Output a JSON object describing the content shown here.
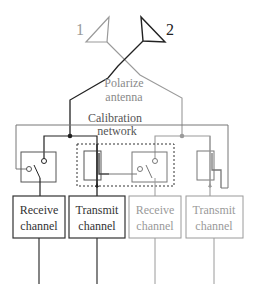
{
  "diagram": {
    "antennas": [
      {
        "label": "1",
        "color": "#9a9a9a"
      },
      {
        "label": "2",
        "color": "#222222"
      }
    ],
    "polarize": {
      "line1": "Polarize",
      "line2": "antenna"
    },
    "calibration": {
      "line1": "Calibration",
      "line2": "network"
    },
    "channels": [
      {
        "line1": "Receive",
        "line2": "channel",
        "color": "#333333"
      },
      {
        "line1": "Transmit",
        "line2": "channel",
        "color": "#333333"
      },
      {
        "line1": "Receive",
        "line2": "channel",
        "color": "#9a9a9a"
      },
      {
        "line1": "Transmit",
        "line2": "channel",
        "color": "#9a9a9a"
      }
    ],
    "colors": {
      "dark": "#222222",
      "light": "#9a9a9a",
      "text_light": "#8a8a8a"
    }
  }
}
